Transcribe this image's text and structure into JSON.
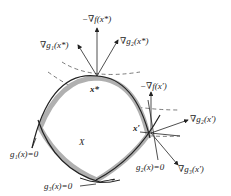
{
  "diagram": {
    "region_label": "X",
    "optimum_label": "x*",
    "point_label": "x′",
    "gradients_at_optimum": {
      "neg_grad_f": "−∇f(x*)",
      "grad_g1": "∇g₁(x*)",
      "grad_g2": "∇g₂(x*)"
    },
    "gradients_at_point": {
      "neg_grad_f": "−∇f(x′)",
      "grad_g2": "∇g₂(x′)",
      "grad_g3": "∇g₃(x′)"
    },
    "constraints": {
      "g1": "g₁(x)=0",
      "g2": "g₂(x)=0",
      "g3": "g₃(x)=0"
    }
  }
}
